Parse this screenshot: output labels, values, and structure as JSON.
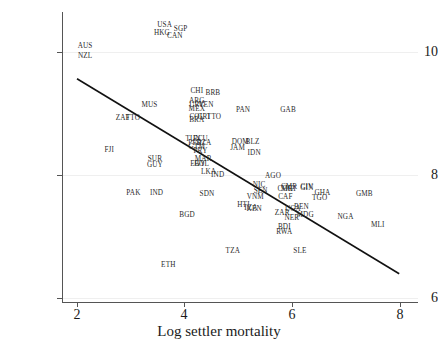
{
  "chart_data": {
    "type": "scatter",
    "title": "",
    "xlabel": "Log settler mortality",
    "ylabel": "",
    "xlim": [
      1.72,
      8.35
    ],
    "ylim": [
      5.72,
      10.45
    ],
    "xticks": [
      2,
      4,
      6,
      8
    ],
    "yticks": [
      6,
      8,
      10
    ],
    "grid": true,
    "legend": "none",
    "point_label_type": "country-iso3",
    "fit_line": {
      "type": "linear",
      "x_start": 2.0,
      "y_start": 9.36,
      "x_end": 8.0,
      "y_end": 6.18,
      "slope": -0.53,
      "intercept": 10.42
    },
    "points": [
      {
        "label": "USA",
        "x": 3.63,
        "y": 10.22
      },
      {
        "label": "SGP",
        "x": 3.93,
        "y": 10.16
      },
      {
        "label": "HKG",
        "x": 3.58,
        "y": 10.1
      },
      {
        "label": "CAN",
        "x": 3.82,
        "y": 10.05
      },
      {
        "label": "AUS",
        "x": 2.15,
        "y": 9.88
      },
      {
        "label": "NZL",
        "x": 2.15,
        "y": 9.72
      },
      {
        "label": "CHI",
        "x": 4.23,
        "y": 9.14
      },
      {
        "label": "BRB",
        "x": 4.53,
        "y": 9.11
      },
      {
        "label": "ARG",
        "x": 4.23,
        "y": 8.99
      },
      {
        "label": "URY",
        "x": 4.23,
        "y": 8.92
      },
      {
        "label": "VEN",
        "x": 4.4,
        "y": 8.92
      },
      {
        "label": "MEX",
        "x": 4.23,
        "y": 8.86
      },
      {
        "label": "MUS",
        "x": 3.35,
        "y": 8.92
      },
      {
        "label": "ZAF",
        "x": 2.85,
        "y": 8.7
      },
      {
        "label": "TTO",
        "x": 3.04,
        "y": 8.7
      },
      {
        "label": "PAN",
        "x": 5.09,
        "y": 8.83
      },
      {
        "label": "GAB",
        "x": 5.93,
        "y": 8.83
      },
      {
        "label": "COL",
        "x": 4.23,
        "y": 8.73
      },
      {
        "label": "CRI",
        "x": 4.36,
        "y": 8.73
      },
      {
        "label": "TTO2",
        "x": 4.55,
        "y": 8.73
      },
      {
        "label": "BRA",
        "x": 4.23,
        "y": 8.68
      },
      {
        "label": "TUN",
        "x": 4.16,
        "y": 8.37
      },
      {
        "label": "ECU",
        "x": 4.3,
        "y": 8.37
      },
      {
        "label": "PER",
        "x": 4.2,
        "y": 8.3
      },
      {
        "label": "DZA",
        "x": 4.36,
        "y": 8.3
      },
      {
        "label": "GTM",
        "x": 4.23,
        "y": 8.23
      },
      {
        "label": "PRY",
        "x": 4.3,
        "y": 8.16
      },
      {
        "label": "DOM",
        "x": 5.04,
        "y": 8.32
      },
      {
        "label": "BLZ",
        "x": 5.27,
        "y": 8.32
      },
      {
        "label": "JAM",
        "x": 4.99,
        "y": 8.22
      },
      {
        "label": "IDN",
        "x": 5.3,
        "y": 8.14
      },
      {
        "label": "FJI",
        "x": 2.6,
        "y": 8.18
      },
      {
        "label": "MAR",
        "x": 4.35,
        "y": 8.03
      },
      {
        "label": "EGY",
        "x": 4.25,
        "y": 7.96
      },
      {
        "label": "BOL",
        "x": 4.32,
        "y": 7.96
      },
      {
        "label": "SUR",
        "x": 3.45,
        "y": 8.03
      },
      {
        "label": "GUY",
        "x": 3.45,
        "y": 7.94
      },
      {
        "label": "LKA",
        "x": 4.45,
        "y": 7.82
      },
      {
        "label": "IND",
        "x": 4.62,
        "y": 7.78
      },
      {
        "label": "AGO",
        "x": 5.65,
        "y": 7.76
      },
      {
        "label": "NIC",
        "x": 5.39,
        "y": 7.62
      },
      {
        "label": "CMR",
        "x": 5.95,
        "y": 7.58
      },
      {
        "label": "COG",
        "x": 5.88,
        "y": 7.54
      },
      {
        "label": "CIV",
        "x": 6.28,
        "y": 7.58
      },
      {
        "label": "GIN",
        "x": 6.28,
        "y": 7.56
      },
      {
        "label": "PAK",
        "x": 3.05,
        "y": 7.49
      },
      {
        "label": "IND2",
        "x": 3.48,
        "y": 7.49
      },
      {
        "label": "SDN",
        "x": 4.42,
        "y": 7.47
      },
      {
        "label": "SEN",
        "x": 5.42,
        "y": 7.52
      },
      {
        "label": "MRT",
        "x": 5.95,
        "y": 7.54
      },
      {
        "label": "GHA",
        "x": 6.57,
        "y": 7.49
      },
      {
        "label": "GMB",
        "x": 7.35,
        "y": 7.47
      },
      {
        "label": "VNM",
        "x": 5.32,
        "y": 7.42
      },
      {
        "label": "CAF",
        "x": 5.88,
        "y": 7.42
      },
      {
        "label": "TGO",
        "x": 6.52,
        "y": 7.4
      },
      {
        "label": "HTI",
        "x": 5.1,
        "y": 7.28
      },
      {
        "label": "TZA2",
        "x": 5.23,
        "y": 7.24
      },
      {
        "label": "KEN",
        "x": 5.3,
        "y": 7.22
      },
      {
        "label": "BEN",
        "x": 6.18,
        "y": 7.26
      },
      {
        "label": "BGD",
        "x": 4.05,
        "y": 7.13
      },
      {
        "label": "ZAR",
        "x": 5.82,
        "y": 7.15
      },
      {
        "label": "UGA",
        "x": 6.02,
        "y": 7.22
      },
      {
        "label": "MDG",
        "x": 6.25,
        "y": 7.13
      },
      {
        "label": "NER",
        "x": 6.0,
        "y": 7.07
      },
      {
        "label": "NGA",
        "x": 7.0,
        "y": 7.09
      },
      {
        "label": "MLI",
        "x": 7.6,
        "y": 6.96
      },
      {
        "label": "BDI",
        "x": 5.86,
        "y": 6.92
      },
      {
        "label": "RWA",
        "x": 5.86,
        "y": 6.85
      },
      {
        "label": "TZA",
        "x": 4.9,
        "y": 6.54
      },
      {
        "label": "SLE",
        "x": 6.15,
        "y": 6.54
      },
      {
        "label": "ETH",
        "x": 3.7,
        "y": 6.3
      }
    ]
  },
  "axes": {
    "x_title": "Log settler mortality",
    "x_tick_labels": [
      "2",
      "4",
      "6",
      "8"
    ],
    "y_tick_labels": [
      "6",
      "8",
      "10"
    ]
  },
  "colors": {
    "background": "#ffffff",
    "axis": "#555555",
    "text": "#1a1a1a",
    "point_label": "#2a2a2a",
    "grid": "#efefef",
    "fit_line": "#111111"
  }
}
